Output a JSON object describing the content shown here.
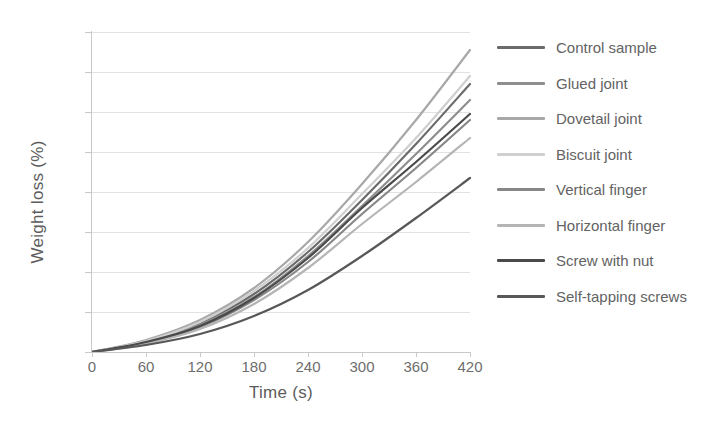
{
  "chart_data": {
    "type": "line",
    "title": "",
    "xlabel": "Time (s)",
    "ylabel": "Weight loss (%)",
    "xlim": [
      0,
      420
    ],
    "ylim": [
      0,
      16
    ],
    "xticks": [
      0,
      60,
      120,
      180,
      240,
      300,
      360,
      420
    ],
    "yticks": [
      0,
      2,
      4,
      6,
      8,
      10,
      12,
      14,
      16
    ],
    "grid": "horizontal",
    "legend_position": "right",
    "x": [
      0,
      60,
      120,
      180,
      240,
      300,
      360,
      420
    ],
    "series": [
      {
        "name": "Control sample",
        "color": "#6b6b6b",
        "values": [
          0,
          0.55,
          1.45,
          2.9,
          5.0,
          7.6,
          10.4,
          13.4
        ]
      },
      {
        "name": "Glued joint",
        "color": "#8e8e8e",
        "values": [
          0,
          0.5,
          1.35,
          2.75,
          4.8,
          7.3,
          9.9,
          12.6
        ]
      },
      {
        "name": "Dovetail joint",
        "color": "#a8a8a8",
        "values": [
          0,
          0.6,
          1.6,
          3.2,
          5.5,
          8.4,
          11.6,
          15.1
        ]
      },
      {
        "name": "Biscuit joint",
        "color": "#cfcfcf",
        "values": [
          0,
          0.55,
          1.5,
          3.05,
          5.2,
          7.9,
          10.7,
          13.8
        ]
      },
      {
        "name": "Vertical finger",
        "color": "#878787",
        "values": [
          0,
          0.45,
          1.25,
          2.6,
          4.5,
          6.9,
          9.2,
          11.6
        ]
      },
      {
        "name": "Horizontal finger",
        "color": "#b5b5b5",
        "values": [
          0,
          0.42,
          1.15,
          2.4,
          4.2,
          6.4,
          8.5,
          10.7
        ]
      },
      {
        "name": "Screw with nut",
        "color": "#4a4a4a",
        "values": [
          0,
          0.5,
          1.3,
          2.7,
          4.7,
          7.2,
          9.5,
          11.9
        ]
      },
      {
        "name": "Self-tapping screws",
        "color": "#585858",
        "values": [
          0,
          0.35,
          0.9,
          1.8,
          3.1,
          4.8,
          6.7,
          8.7
        ]
      }
    ]
  },
  "legend": {
    "items": [
      {
        "label": "Control sample"
      },
      {
        "label": "Glued joint"
      },
      {
        "label": "Dovetail joint"
      },
      {
        "label": "Biscuit joint"
      },
      {
        "label": "Vertical finger"
      },
      {
        "label": "Horizontal finger"
      },
      {
        "label": "Screw with nut"
      },
      {
        "label": "Self-tapping screws"
      }
    ]
  }
}
